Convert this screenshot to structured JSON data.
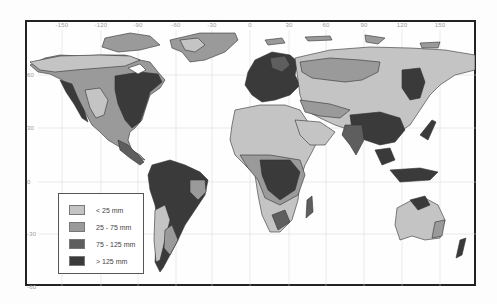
{
  "map": {
    "title": "",
    "longitude_ticks": [
      {
        "label": "-150",
        "x": 62
      },
      {
        "label": "-120",
        "x": 101
      },
      {
        "label": "-90",
        "x": 138
      },
      {
        "label": "-60",
        "x": 176
      },
      {
        "label": "-30",
        "x": 212
      },
      {
        "label": "0",
        "x": 250
      },
      {
        "label": "30",
        "x": 289
      },
      {
        "label": "60",
        "x": 326
      },
      {
        "label": "90",
        "x": 364
      },
      {
        "label": "120",
        "x": 402
      },
      {
        "label": "150",
        "x": 440
      }
    ],
    "latitude_ticks": [
      {
        "label": "60",
        "y": 75
      },
      {
        "label": "30",
        "y": 128
      },
      {
        "label": "0",
        "y": 182
      },
      {
        "label": "-30",
        "y": 234
      },
      {
        "label": "-60",
        "y": 287
      }
    ],
    "colors": {
      "class_lt25": "#c4c4c4",
      "class_25_75": "#9a9a9a",
      "class_75_125": "#5e5e5e",
      "class_gt125": "#3a3a3a",
      "ocean": "#fefefe",
      "frame": "#222222"
    }
  },
  "legend": {
    "items": [
      {
        "label": "< 25 mm",
        "color": "#c4c4c4"
      },
      {
        "label": "25 - 75 mm",
        "color": "#9a9a9a"
      },
      {
        "label": "75 - 125 mm",
        "color": "#5e5e5e"
      },
      {
        "label": "> 125 mm",
        "color": "#3a3a3a"
      }
    ]
  }
}
